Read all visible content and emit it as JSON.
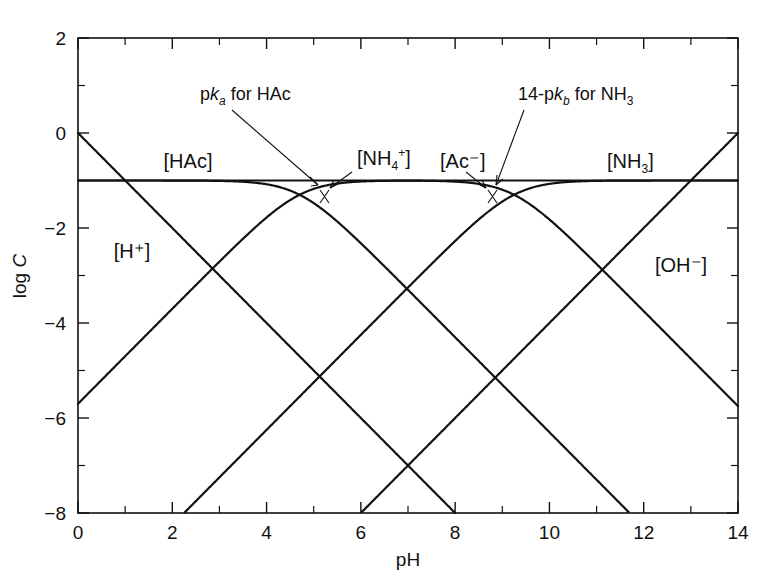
{
  "chart_data": {
    "type": "line",
    "title": "",
    "xlabel": "pH",
    "ylabel": "log C",
    "xlim": [
      0,
      14
    ],
    "ylim": [
      -8,
      2
    ],
    "xticks": [
      0,
      2,
      4,
      6,
      8,
      10,
      12,
      14
    ],
    "xticklabels": [
      "0",
      "2",
      "4",
      "6",
      "8",
      "10",
      "12",
      "14"
    ],
    "xminorticks": [
      1,
      3,
      5,
      7,
      9,
      11,
      13
    ],
    "yticks": [
      -8,
      -6,
      -4,
      -2,
      0,
      2
    ],
    "yticklabels": [
      "-8",
      "-6",
      "-4",
      "-2",
      "0",
      "2"
    ],
    "yminorticks": [
      -7,
      -5,
      -3,
      -1,
      1
    ],
    "grid": false,
    "legend_position": "inline-labels",
    "total_concentration_log": -1,
    "series": [
      {
        "name": "[H+]",
        "label": "[H⁺]",
        "kind": "line",
        "slope": -1,
        "points": [
          [
            0,
            0
          ],
          [
            8,
            -8
          ]
        ]
      },
      {
        "name": "[OH-]",
        "label": "[OH⁻]",
        "kind": "line",
        "slope": 1,
        "points": [
          [
            0,
            -5.7
          ],
          [
            14,
            0
          ]
        ]
      },
      {
        "name": "[HAc]",
        "label": "[HAc]",
        "kind": "curve",
        "pK": 4.7,
        "plateau": -1,
        "points": [
          [
            0,
            -1.0
          ],
          [
            2,
            -1.0
          ],
          [
            4,
            -1.03
          ],
          [
            4.7,
            -1.3
          ],
          [
            5.5,
            -1.85
          ],
          [
            7,
            -3.3
          ],
          [
            9,
            -5.3
          ],
          [
            11,
            -7.3
          ],
          [
            12.7,
            -9.0
          ],
          [
            14,
            -5.7
          ]
        ]
      },
      {
        "name": "[Ac-]",
        "label": "[Ac⁻]",
        "kind": "curve",
        "pK": 4.7,
        "plateau": -1,
        "points": [
          [
            2.6,
            -8.0
          ],
          [
            3.5,
            -7.0
          ],
          [
            4.7,
            -1.3
          ],
          [
            6,
            -1.05
          ],
          [
            9,
            -1.0
          ],
          [
            14,
            -1.0
          ]
        ]
      },
      {
        "name": "[NH4+]",
        "label": "[NH₄⁺]",
        "kind": "curve",
        "pK": 9.25,
        "plateau": -1,
        "points": [
          [
            6.0,
            -8.0
          ],
          [
            7.5,
            -6.5
          ],
          [
            9.25,
            -1.3
          ],
          [
            10.5,
            -1.05
          ],
          [
            12,
            -1.0
          ],
          [
            14,
            -1.0
          ]
        ]
      },
      {
        "name": "[NH3]",
        "label": "[NH₃]",
        "kind": "curve",
        "pK": 9.25,
        "plateau": -1,
        "points": [
          [
            0,
            -1.0
          ],
          [
            6,
            -1.0
          ],
          [
            8.5,
            -1.05
          ],
          [
            9.25,
            -1.3
          ],
          [
            10.5,
            -2.4
          ],
          [
            11.6,
            -8.0
          ]
        ]
      }
    ],
    "annotations": [
      {
        "id": "pka-hac",
        "text_parts": {
          "pre": "p",
          "ital": "k",
          "sub": "a",
          "post": " for HAc"
        },
        "text": "pka for HAc",
        "target_pH": 4.7,
        "target_logC": -1.25
      },
      {
        "id": "pkb-nh3",
        "text_parts": {
          "pre": "14-p",
          "ital": "k",
          "sub": "b",
          "post": " for NH₃"
        },
        "text": "14-pkb for NH3",
        "target_pH": 9.25,
        "target_logC": -1.25
      }
    ],
    "species_labels": [
      {
        "id": "hac",
        "text": "[HAc]",
        "pH": 2.35,
        "logC": -0.55
      },
      {
        "id": "h",
        "text": "[H⁺]",
        "pH": 1.15,
        "logC": -2.1
      },
      {
        "id": "nh4",
        "text": "[NH₄⁺]",
        "pH": 5.8,
        "logC": -0.62
      },
      {
        "id": "ac",
        "text": "[Ac⁻]",
        "pH": 8.05,
        "logC": -0.6
      },
      {
        "id": "nh3",
        "text": "[NH₃]",
        "pH": 12.0,
        "logC": -0.58
      },
      {
        "id": "oh",
        "text": "[OH⁻]",
        "pH": 12.6,
        "logC": -2.85
      }
    ]
  },
  "figure": {
    "axis_x_label": "pH",
    "axis_y_label_pre": "log ",
    "axis_y_label_var": "C",
    "stroke_color": "#111111",
    "background_color": "#ffffff"
  }
}
